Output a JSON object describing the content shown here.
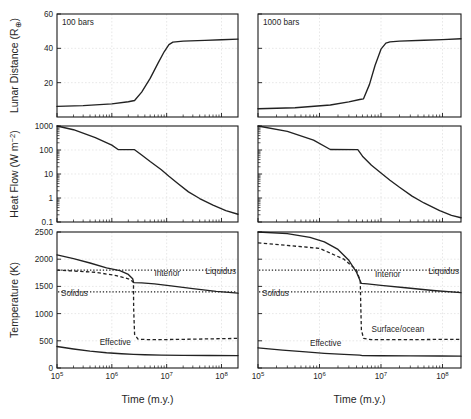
{
  "figure": {
    "xlabel": "Time (m.y.)",
    "columns": [
      {
        "tag": "100 bars"
      },
      {
        "tag": "1000 bars"
      }
    ]
  },
  "rows": [
    {
      "id": "lunar-distance",
      "ylabel_prefix": "Lunar Distance (R",
      "ylabel_sub": "⊕",
      "ylabel_suffix": ")",
      "yticks": [
        "60",
        "40",
        "20"
      ],
      "ytick_values": [
        60,
        40,
        20
      ],
      "ylim": [
        0,
        60
      ]
    },
    {
      "id": "heat-flow",
      "ylabel_prefix": "Heat Flow (W m",
      "ylabel_sup": "−2",
      "ylabel_suffix": ")",
      "yticks": [
        "1000",
        "100",
        "10",
        "1",
        "0.1"
      ],
      "ytick_values": [
        1000,
        100,
        10,
        1,
        0.1
      ],
      "ylim": [
        0.1,
        1000
      ]
    },
    {
      "id": "temperature",
      "ylabel_prefix": "Temperature (K)",
      "yticks": [
        "2500",
        "2000",
        "1500",
        "1000",
        "500",
        "0"
      ],
      "ytick_values": [
        2500,
        2000,
        1500,
        1000,
        500,
        0
      ],
      "ylim": [
        0,
        2500
      ]
    }
  ],
  "xaxis": {
    "ticklabels": [
      "10",
      "10",
      "10",
      "10"
    ],
    "tickexp": [
      "5",
      "6",
      "7",
      "8"
    ],
    "tickvalues": [
      100000,
      1000000,
      10000000,
      100000000
    ],
    "xlim": [
      100000,
      200000000
    ],
    "log": true
  },
  "annotations": {
    "liquidus": "Liquidus",
    "solidus": "Solidus",
    "interior": "Interior",
    "effective": "Effective",
    "surface_ocean": "Surface/ocean"
  },
  "chart_data": {
    "type": "line",
    "title": "",
    "xlabel": "Time (m.y.)",
    "xlim": [
      100000,
      200000000
    ],
    "xscale": "log",
    "grid": true,
    "legend": "inline-annotations",
    "panels": [
      {
        "row": "lunar-distance",
        "column": "100 bars",
        "ylabel": "Lunar Distance (R⊕)",
        "ylim": [
          0,
          60
        ],
        "yscale": "linear",
        "series": [
          {
            "name": "lunar distance",
            "style": "solid",
            "x": [
              100000,
              300000,
              1000000,
              2000000,
              2600000,
              3500000,
              5000000,
              7000000,
              9000000,
              11000000,
              13000000,
              20000000,
              50000000,
              100000000,
              200000000
            ],
            "y": [
              6.2,
              6.6,
              7.6,
              8.9,
              9.6,
              14.5,
              22.5,
              31.5,
              38.0,
              42.2,
              43.6,
              44.2,
              44.6,
              45.0,
              45.4
            ]
          }
        ]
      },
      {
        "row": "lunar-distance",
        "column": "1000 bars",
        "ylabel": "Lunar Distance (R⊕)",
        "ylim": [
          0,
          60
        ],
        "yscale": "linear",
        "series": [
          {
            "name": "lunar distance",
            "style": "solid",
            "x": [
              100000,
              400000,
              1500000,
              3000000,
              4500000,
              5200000,
              6500000,
              8000000,
              10000000,
              12000000,
              14000000,
              20000000,
              50000000,
              100000000,
              200000000
            ],
            "y": [
              4.8,
              5.4,
              7.0,
              8.8,
              10.2,
              10.6,
              19.0,
              30.0,
              39.5,
              43.0,
              43.8,
              44.2,
              44.7,
              45.1,
              45.6
            ]
          }
        ]
      },
      {
        "row": "heat-flow",
        "column": "100 bars",
        "ylabel": "Heat Flow (W m−2)",
        "ylim": [
          0.1,
          1000
        ],
        "yscale": "log",
        "series": [
          {
            "name": "heat flow",
            "style": "solid",
            "x": [
              100000,
              200000,
              500000,
              1000000,
              1300000,
              2600000,
              3500000,
              5000000,
              8000000,
              11000000,
              16000000,
              25000000,
              40000000,
              70000000,
              120000000,
              200000000
            ],
            "y": [
              1000,
              700,
              330,
              160,
              105,
              103,
              62,
              33,
              15,
              8.0,
              4.0,
              1.8,
              0.95,
              0.5,
              0.3,
              0.21
            ]
          }
        ]
      },
      {
        "row": "heat-flow",
        "column": "1000 bars",
        "ylabel": "Heat Flow (W m−2)",
        "ylim": [
          0.1,
          1000
        ],
        "yscale": "log",
        "series": [
          {
            "name": "heat flow",
            "style": "solid",
            "x": [
              100000,
              300000,
              800000,
              1500000,
              4200000,
              5000000,
              7000000,
              10000000,
              14000000,
              20000000,
              32000000,
              50000000,
              90000000,
              140000000,
              200000000
            ],
            "y": [
              1000,
              600,
              260,
              105,
              103,
              55,
              23,
              11,
              5.5,
              2.8,
              1.2,
              0.62,
              0.3,
              0.19,
              0.15
            ]
          }
        ]
      },
      {
        "row": "temperature",
        "column": "100 bars",
        "ylabel": "Temperature (K)",
        "ylim": [
          0,
          2500
        ],
        "yscale": "linear",
        "reference_lines": [
          {
            "name": "Liquidus",
            "value": 1800,
            "style": "dotted"
          },
          {
            "name": "Solidus",
            "value": 1400,
            "style": "dotted"
          }
        ],
        "series": [
          {
            "name": "Interior",
            "style": "solid",
            "x": [
              100000,
              200000,
              400000,
              800000,
              1400000,
              2000000,
              2400000,
              2500000,
              3500000,
              6000000,
              12000000,
              30000000,
              80000000,
              200000000
            ],
            "y": [
              2080,
              2010,
              1930,
              1840,
              1790,
              1720,
              1640,
              1570,
              1565,
              1545,
              1510,
              1460,
              1410,
              1375
            ]
          },
          {
            "name": "Surface/ocean",
            "style": "dashed",
            "x": [
              100000,
              500000,
              1200000,
              2000000,
              2400000,
              2480000,
              2500000,
              2600000,
              3000000,
              5000000,
              15000000,
              60000000,
              200000000
            ],
            "y": [
              1800,
              1760,
              1700,
              1640,
              1590,
              1570,
              1100,
              620,
              530,
              520,
              525,
              535,
              545
            ]
          },
          {
            "name": "Effective",
            "style": "solid",
            "x": [
              100000,
              200000,
              400000,
              800000,
              1500000,
              2500000,
              4000000,
              8000000,
              20000000,
              60000000,
              200000000
            ],
            "y": [
              395,
              350,
              310,
              280,
              262,
              250,
              243,
              238,
              233,
              230,
              228
            ]
          }
        ]
      },
      {
        "row": "temperature",
        "column": "1000 bars",
        "ylabel": "Temperature (K)",
        "ylim": [
          0,
          2500
        ],
        "yscale": "linear",
        "reference_lines": [
          {
            "name": "Liquidus",
            "value": 1800,
            "style": "dotted"
          },
          {
            "name": "Solidus",
            "value": 1400,
            "style": "dotted"
          }
        ],
        "series": [
          {
            "name": "Interior",
            "style": "solid",
            "x": [
              100000,
              300000,
              700000,
              1200000,
              2000000,
              3000000,
              4000000,
              4600000,
              4800000,
              6000000,
              10000000,
              25000000,
              70000000,
              200000000
            ],
            "y": [
              2500,
              2470,
              2400,
              2320,
              2180,
              1980,
              1760,
              1600,
              1555,
              1545,
              1520,
              1475,
              1425,
              1385
            ]
          },
          {
            "name": "Surface/ocean",
            "style": "dashed",
            "x": [
              100000,
              1000000,
              2500000,
              4000000,
              4600000,
              4700000,
              4800000,
              5200000,
              7000000,
              20000000,
              80000000,
              200000000
            ],
            "y": [
              2300,
              2200,
              2000,
              1800,
              1600,
              1100,
              700,
              545,
              520,
              520,
              525,
              528
            ]
          },
          {
            "name": "Effective",
            "style": "solid",
            "x": [
              100000,
              250000,
              600000,
              1200000,
              2500000,
              4500000,
              5000000,
              10000000,
              30000000,
              90000000,
              200000000
            ],
            "y": [
              370,
              330,
              295,
              270,
              250,
              238,
              228,
              225,
              222,
              220,
              218
            ]
          }
        ]
      }
    ]
  }
}
